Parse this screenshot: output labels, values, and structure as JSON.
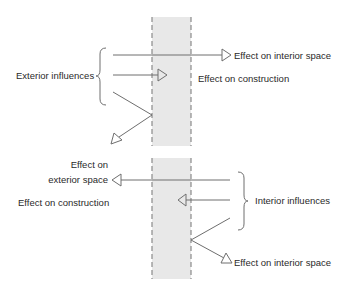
{
  "diagram": {
    "colors": {
      "wall_fill": "#e8e8e8",
      "wall_edge": "#8a8a8a",
      "line": "#6e6e6e",
      "text": "#2a2a2a",
      "background": "#ffffff"
    },
    "upper": {
      "source_label": "Exterior influences",
      "effects": [
        {
          "id": "transmitted",
          "label": "Effect on interior space",
          "direction": "right"
        },
        {
          "id": "absorbed",
          "label": "Effect on construction",
          "direction": "right"
        },
        {
          "id": "reflected",
          "label": "",
          "direction": "down-left"
        }
      ]
    },
    "lower": {
      "source_label": "Interior influences",
      "effects": [
        {
          "id": "transmitted",
          "label_line1": "Effect on",
          "label_line2": "exterior space",
          "direction": "left"
        },
        {
          "id": "absorbed",
          "label": "Effect on construction",
          "direction": "left"
        },
        {
          "id": "reflected",
          "label": "Effect on interior space",
          "direction": "down-right"
        }
      ]
    }
  }
}
